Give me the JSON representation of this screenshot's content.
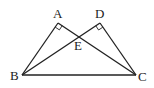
{
  "diagram": {
    "type": "geometry",
    "points": {
      "A": {
        "label": "A",
        "x": 58,
        "y": 23
      },
      "D": {
        "label": "D",
        "x": 100,
        "y": 23
      },
      "E": {
        "label": "E",
        "x": 78,
        "y": 36
      },
      "B": {
        "label": "B",
        "x": 22,
        "y": 75
      },
      "C": {
        "label": "C",
        "x": 136,
        "y": 75
      }
    },
    "segments": [
      "AB",
      "AC",
      "DB",
      "DC",
      "BC"
    ],
    "right_angles": [
      "A",
      "D"
    ],
    "labels": {
      "A": "A",
      "D": "D",
      "E": "E",
      "B": "B",
      "C": "C"
    }
  }
}
